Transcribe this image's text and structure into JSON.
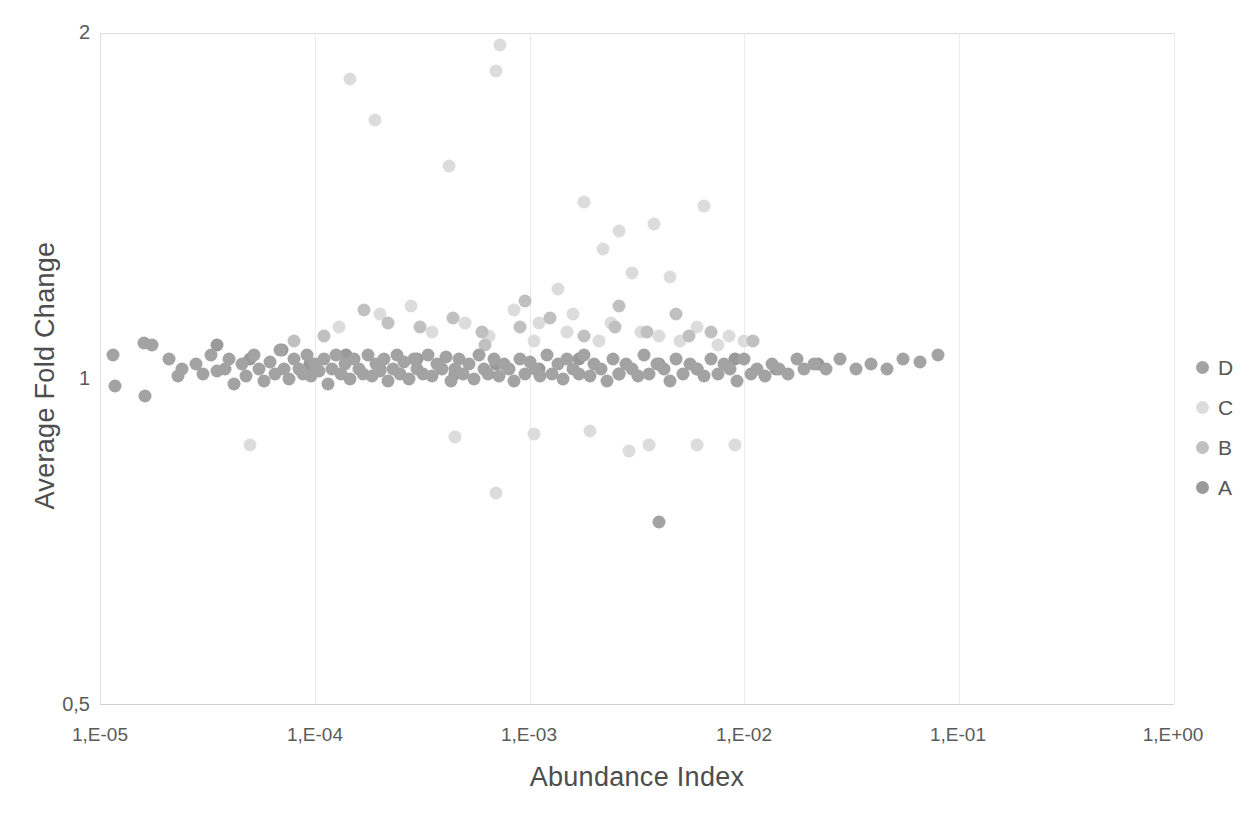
{
  "chart_data": {
    "type": "scatter",
    "title": "",
    "xlabel": "Abundance Index",
    "ylabel": "Average Fold Change",
    "x_scale": "log",
    "y_scale": "log",
    "xlim": [
      1e-05,
      1
    ],
    "ylim": [
      0.5,
      2
    ],
    "x_ticks": [
      "1,E-05",
      "1,E-04",
      "1,E-03",
      "1,E-02",
      "1,E-01",
      "1,E+00"
    ],
    "x_tick_values": [
      1e-05,
      0.0001,
      0.001,
      0.01,
      0.1,
      1
    ],
    "y_ticks": [
      "2",
      "1",
      "0,5"
    ],
    "y_tick_values": [
      2,
      1,
      0.5
    ],
    "grid": "vertical-only",
    "legend_position": "right",
    "series": [
      {
        "name": "D",
        "color": "#a3a3a3",
        "points": [
          [
            1.15e-05,
            1.03
          ],
          [
            1.18e-05,
            0.965
          ],
          [
            1.6e-05,
            1.055
          ],
          [
            1.75e-05,
            1.05
          ],
          [
            1.62e-05,
            0.945
          ],
          [
            2.1e-05,
            1.02
          ],
          [
            2.4e-05,
            1.0
          ],
          [
            2.3e-05,
            0.985
          ],
          [
            2.8e-05,
            1.01
          ],
          [
            3e-05,
            0.99
          ],
          [
            3.3e-05,
            1.03
          ],
          [
            3.5e-05,
            0.995
          ],
          [
            3.8e-05,
            1.0
          ],
          [
            4e-05,
            1.02
          ],
          [
            4.2e-05,
            0.97
          ],
          [
            4.6e-05,
            1.01
          ],
          [
            4.8e-05,
            0.985
          ],
          [
            5.2e-05,
            1.03
          ],
          [
            5.5e-05,
            1.0
          ],
          [
            5.8e-05,
            0.975
          ],
          [
            6.2e-05,
            1.015
          ],
          [
            6.5e-05,
            0.99
          ],
          [
            6.9e-05,
            1.04
          ],
          [
            7.2e-05,
            1.0
          ],
          [
            7.6e-05,
            0.98
          ],
          [
            8e-05,
            1.02
          ],
          [
            8.4e-05,
            1.0
          ],
          [
            8.8e-05,
            0.99
          ],
          [
            9.2e-05,
            1.03
          ],
          [
            9.6e-05,
            0.985
          ],
          [
            0.0001,
            1.01
          ],
          [
            0.000105,
            0.995
          ],
          [
            0.00011,
            1.02
          ],
          [
            0.000115,
            0.97
          ],
          [
            0.00012,
            1.0
          ],
          [
            0.000126,
            1.03
          ],
          [
            0.000132,
            0.99
          ],
          [
            0.000138,
            1.01
          ],
          [
            0.000145,
            0.98
          ],
          [
            0.000152,
            1.02
          ],
          [
            0.00016,
            1.0
          ],
          [
            0.000168,
            0.99
          ],
          [
            0.000176,
            1.03
          ],
          [
            0.000184,
            0.985
          ],
          [
            0.000193,
            1.01
          ],
          [
            0.0002,
            0.995
          ],
          [
            0.00021,
            1.02
          ],
          [
            0.00022,
            0.975
          ],
          [
            0.00023,
            1.0
          ],
          [
            0.00024,
            1.03
          ],
          [
            0.00025,
            0.99
          ],
          [
            0.00026,
            1.015
          ],
          [
            0.000275,
            0.98
          ],
          [
            0.00029,
            1.02
          ],
          [
            0.0003,
            1.0
          ],
          [
            0.00032,
            0.99
          ],
          [
            0.000335,
            1.03
          ],
          [
            0.00035,
            0.985
          ],
          [
            0.00037,
            1.01
          ],
          [
            0.00039,
            1.0
          ],
          [
            0.00041,
            1.025
          ],
          [
            0.00043,
            0.975
          ],
          [
            0.00045,
            1.0
          ],
          [
            0.00047,
            1.02
          ],
          [
            0.00049,
            0.99
          ],
          [
            0.00052,
            1.01
          ],
          [
            0.00055,
            0.98
          ],
          [
            0.00058,
            1.03
          ],
          [
            0.00061,
            1.0
          ],
          [
            0.00064,
            0.99
          ],
          [
            0.00068,
            1.02
          ],
          [
            0.00072,
            0.985
          ],
          [
            0.00076,
            1.01
          ],
          [
            0.0008,
            1.0
          ],
          [
            0.00085,
            0.975
          ],
          [
            0.0009,
            1.02
          ],
          [
            0.00095,
            0.99
          ],
          [
            0.001,
            1.015
          ],
          [
            0.00106,
            1.0
          ],
          [
            0.00112,
            0.985
          ],
          [
            0.0012,
            1.03
          ],
          [
            0.00127,
            0.99
          ],
          [
            0.00135,
            1.01
          ],
          [
            0.00143,
            0.98
          ],
          [
            0.0015,
            1.02
          ],
          [
            0.0016,
            1.0
          ],
          [
            0.0017,
            0.99
          ],
          [
            0.0018,
            1.03
          ],
          [
            0.0019,
            0.985
          ],
          [
            0.002,
            1.01
          ],
          [
            0.00215,
            1.0
          ],
          [
            0.0023,
            0.975
          ],
          [
            0.00245,
            1.02
          ],
          [
            0.0026,
            0.99
          ],
          [
            0.0028,
            1.01
          ],
          [
            0.003,
            1.0
          ],
          [
            0.0032,
            0.985
          ],
          [
            0.0034,
            1.03
          ],
          [
            0.0036,
            0.99
          ],
          [
            0.0039,
            1.01
          ],
          [
            0.0042,
            1.0
          ],
          [
            0.0045,
            0.975
          ],
          [
            0.0048,
            1.02
          ],
          [
            0.0052,
            0.99
          ],
          [
            0.0056,
            1.01
          ],
          [
            0.006,
            1.0
          ],
          [
            0.0065,
            0.985
          ],
          [
            0.007,
            1.02
          ],
          [
            0.0075,
            0.99
          ],
          [
            0.008,
            1.01
          ],
          [
            0.0086,
            1.0
          ],
          [
            0.0092,
            0.975
          ],
          [
            0.01,
            1.02
          ],
          [
            0.0107,
            0.99
          ],
          [
            0.0115,
            1.0
          ],
          [
            0.0125,
            0.985
          ],
          [
            0.0135,
            1.01
          ],
          [
            0.0145,
            1.0
          ],
          [
            0.016,
            0.99
          ],
          [
            0.0175,
            1.02
          ],
          [
            0.019,
            1.0
          ],
          [
            0.021,
            1.01
          ],
          [
            0.024,
            1.0
          ],
          [
            0.028,
            1.02
          ],
          [
            0.033,
            1.0
          ],
          [
            0.039,
            1.01
          ],
          [
            0.046,
            1.0
          ],
          [
            0.055,
            1.02
          ],
          [
            0.066,
            1.015
          ],
          [
            0.08,
            1.03
          ],
          [
            0.004,
            0.73
          ]
        ]
      },
      {
        "name": "C",
        "color": "#dcdcdc",
        "points": [
          [
            0.000145,
            1.82
          ],
          [
            0.00073,
            1.95
          ],
          [
            0.00019,
            1.67
          ],
          [
            0.0007,
            1.85
          ],
          [
            0.00042,
            1.52
          ],
          [
            0.0018,
            1.41
          ],
          [
            0.0026,
            1.33
          ],
          [
            0.0038,
            1.35
          ],
          [
            0.0065,
            1.4
          ],
          [
            0.0022,
            1.28
          ],
          [
            0.003,
            1.22
          ],
          [
            0.0045,
            1.21
          ],
          [
            0.00135,
            1.18
          ],
          [
            0.0002,
            1.12
          ],
          [
            0.00028,
            1.14
          ],
          [
            0.0005,
            1.1
          ],
          [
            0.00085,
            1.13
          ],
          [
            0.0011,
            1.1
          ],
          [
            0.0016,
            1.12
          ],
          [
            0.0024,
            1.1
          ],
          [
            0.0033,
            1.08
          ],
          [
            0.006,
            1.09
          ],
          [
            0.0085,
            1.07
          ],
          [
            0.00013,
            1.09
          ],
          [
            0.00035,
            1.08
          ],
          [
            0.00065,
            1.07
          ],
          [
            0.00105,
            1.06
          ],
          [
            0.0015,
            1.08
          ],
          [
            0.0021,
            1.06
          ],
          [
            0.004,
            1.07
          ],
          [
            0.005,
            1.06
          ],
          [
            0.0075,
            1.05
          ],
          [
            0.01,
            1.06
          ],
          [
            0.00045,
            0.87
          ],
          [
            0.00105,
            0.875
          ],
          [
            0.0019,
            0.88
          ],
          [
            0.0029,
            0.845
          ],
          [
            0.0036,
            0.855
          ],
          [
            0.006,
            0.855
          ],
          [
            0.009,
            0.855
          ],
          [
            5e-05,
            0.855
          ],
          [
            0.0007,
            0.775
          ]
        ]
      },
      {
        "name": "B",
        "color": "#c0c0c0",
        "points": [
          [
            0.00017,
            1.13
          ],
          [
            0.00022,
            1.1
          ],
          [
            0.00031,
            1.09
          ],
          [
            0.00044,
            1.11
          ],
          [
            0.0006,
            1.08
          ],
          [
            0.0009,
            1.09
          ],
          [
            0.00125,
            1.11
          ],
          [
            0.0018,
            1.07
          ],
          [
            0.0025,
            1.09
          ],
          [
            0.0035,
            1.08
          ],
          [
            0.0055,
            1.07
          ],
          [
            0.007,
            1.08
          ],
          [
            0.011,
            1.06
          ],
          [
            8e-05,
            1.06
          ],
          [
            0.00011,
            1.07
          ],
          [
            0.0026,
            1.14
          ],
          [
            0.0048,
            1.12
          ],
          [
            0.00095,
            1.15
          ],
          [
            0.00062,
            1.05
          ]
        ]
      },
      {
        "name": "A",
        "color": "#999999",
        "points": [
          [
            3.5e-05,
            1.05
          ],
          [
            5e-05,
            1.02
          ],
          [
            7e-05,
            1.04
          ],
          [
            9.5e-05,
            1.01
          ],
          [
            0.00014,
            1.03
          ],
          [
            0.0002,
            1.0
          ],
          [
            0.0003,
            1.02
          ],
          [
            0.00045,
            0.99
          ],
          [
            0.0007,
            1.01
          ],
          [
            0.0011,
            1.0
          ],
          [
            0.0017,
            1.02
          ],
          [
            0.0026,
            0.99
          ],
          [
            0.004,
            1.01
          ],
          [
            0.006,
            1.0
          ],
          [
            0.009,
            1.02
          ],
          [
            0.014,
            1.0
          ],
          [
            0.022,
            1.01
          ]
        ]
      }
    ]
  },
  "axes": {
    "x_title": "Abundance Index",
    "y_title": "Average Fold Change",
    "y_tick_top": "2",
    "y_tick_mid": "1",
    "y_tick_bottom": "0,5",
    "x_tick_0": "1,E-05",
    "x_tick_1": "1,E-04",
    "x_tick_2": "1,E-03",
    "x_tick_3": "1,E-02",
    "x_tick_4": "1,E-01",
    "x_tick_5": "1,E+00"
  },
  "legend": {
    "items": [
      {
        "label": "D",
        "color": "#a3a3a3"
      },
      {
        "label": "C",
        "color": "#dcdcdc"
      },
      {
        "label": "B",
        "color": "#c0c0c0"
      },
      {
        "label": "A",
        "color": "#999999"
      }
    ]
  }
}
